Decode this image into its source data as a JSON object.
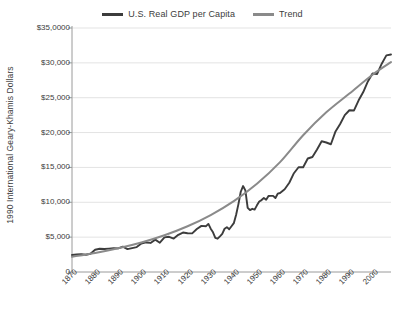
{
  "chart_data": {
    "type": "line",
    "title": "",
    "subtitle": "",
    "xlabel": "",
    "ylabel": "1990 International Geary-Khamis Dollars",
    "xlim": [
      1870,
      2008
    ],
    "ylim": [
      0,
      35000
    ],
    "grid": "horizontal",
    "legend_position": "top-center",
    "y_ticks": [
      0,
      5000,
      10000,
      15000,
      20000,
      25000,
      30000,
      35000
    ],
    "y_tick_labels": [
      "0",
      "$5,000",
      "$10,000",
      "$15,000",
      "$20,000",
      "$25,000",
      "$30,000",
      "$35,0000"
    ],
    "x_ticks": [
      1870,
      1880,
      1890,
      1900,
      1910,
      1920,
      1930,
      1940,
      1950,
      1960,
      1970,
      1980,
      1990,
      2000
    ],
    "x_tick_labels": [
      "1870",
      "1880",
      "1890",
      "1900",
      "1910",
      "1920",
      "1930",
      "1940",
      "1950",
      "1960",
      "1970",
      "1980",
      "1990",
      "2000"
    ],
    "colors": {
      "gdp": "#3c3c3c",
      "trend": "#8a8a8a",
      "grid": "#e3e3e3",
      "axis": "#9a9a9a",
      "text": "#3d3d3d"
    },
    "series": [
      {
        "name": "U.S. Real GDP per Capita",
        "color": "#3c3c3c",
        "x": [
          1870,
          1872,
          1874,
          1876,
          1878,
          1880,
          1882,
          1884,
          1886,
          1888,
          1890,
          1892,
          1894,
          1896,
          1898,
          1900,
          1902,
          1904,
          1906,
          1908,
          1910,
          1912,
          1914,
          1916,
          1918,
          1920,
          1922,
          1924,
          1926,
          1928,
          1929,
          1930,
          1931,
          1932,
          1933,
          1934,
          1935,
          1936,
          1937,
          1938,
          1939,
          1940,
          1941,
          1942,
          1943,
          1944,
          1945,
          1946,
          1947,
          1948,
          1949,
          1950,
          1951,
          1952,
          1953,
          1954,
          1955,
          1956,
          1957,
          1958,
          1959,
          1960,
          1962,
          1964,
          1966,
          1968,
          1970,
          1972,
          1974,
          1976,
          1978,
          1980,
          1982,
          1984,
          1986,
          1988,
          1990,
          1992,
          1994,
          1996,
          1998,
          2000,
          2002,
          2004,
          2006,
          2008
        ],
        "values": [
          2445,
          2510,
          2570,
          2480,
          2620,
          3190,
          3340,
          3290,
          3350,
          3400,
          3392,
          3640,
          3280,
          3430,
          3570,
          4091,
          4240,
          4170,
          4640,
          4200,
          4964,
          5050,
          4790,
          5330,
          5660,
          5552,
          5540,
          6160,
          6620,
          6569,
          6899,
          6213,
          5691,
          4908,
          4777,
          5114,
          5467,
          6204,
          6430,
          6126,
          6561,
          7010,
          8206,
          9741,
          11513,
          12333,
          11709,
          9197,
          8886,
          9065,
          8944,
          9561,
          10116,
          10316,
          10610,
          10359,
          10897,
          10914,
          10920,
          10610,
          11230,
          11328,
          11860,
          12804,
          14171,
          15030,
          15030,
          16284,
          16491,
          17567,
          18750,
          18577,
          18325,
          20166,
          21236,
          22499,
          23201,
          23169,
          24626,
          25816,
          27331,
          28467,
          28410,
          29884,
          31078,
          31200
        ]
      },
      {
        "name": "Trend",
        "color": "#8a8a8a",
        "x": [
          1870,
          1880,
          1890,
          1900,
          1910,
          1920,
          1930,
          1940,
          1950,
          1960,
          1970,
          1980,
          1990,
          2000,
          2008
        ],
        "values": [
          2190,
          2730,
          3400,
          4230,
          5270,
          6560,
          8170,
          10170,
          12660,
          15760,
          19620,
          22900,
          25600,
          28300,
          30100
        ]
      }
    ]
  },
  "legend": {
    "entries": [
      {
        "label": "U.S. Real GDP per Capita",
        "color": "#3c3c3c"
      },
      {
        "label": "Trend",
        "color": "#8a8a8a"
      }
    ]
  }
}
